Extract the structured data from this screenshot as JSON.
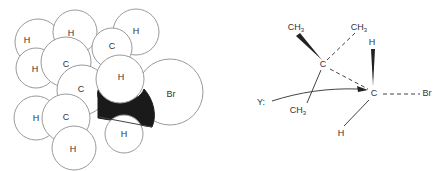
{
  "figure": {
    "space_filling_model": {
      "title": "Space-filling model of 1-bromo-2,2-dimethylpropane (neopentyl bromide)",
      "atoms": [
        {
          "label": "H",
          "cx": 38,
          "cy": 42,
          "r": 23
        },
        {
          "label": "H",
          "cx": 75,
          "cy": 32,
          "r": 22
        },
        {
          "label": "H",
          "cx": 36,
          "cy": 68,
          "r": 20
        },
        {
          "label": "C",
          "cx": 66,
          "cy": 62,
          "r": 25
        },
        {
          "label": "H",
          "cx": 136,
          "cy": 32,
          "r": 23
        },
        {
          "label": "C",
          "cx": 112,
          "cy": 48,
          "r": 20
        },
        {
          "label": "C",
          "cx": 82,
          "cy": 90,
          "r": 25
        },
        {
          "label": "H",
          "cx": 36,
          "cy": 118,
          "r": 22
        },
        {
          "label": "C",
          "cx": 66,
          "cy": 118,
          "r": 24
        },
        {
          "label": "H",
          "cx": 74,
          "cy": 148,
          "r": 22
        },
        {
          "label": "Br",
          "cx": 170,
          "cy": 92,
          "r": 33
        },
        {
          "label": "H",
          "cx": 124,
          "cy": 132,
          "r": 24
        },
        {
          "label": "H",
          "cx": 120,
          "cy": 79,
          "r": 24
        }
      ],
      "labels": [
        {
          "text": "H",
          "x": 27,
          "y": 41
        },
        {
          "text": "H",
          "x": 71,
          "y": 34
        },
        {
          "text": "H",
          "x": 35,
          "y": 70
        },
        {
          "text": "C",
          "x": 66,
          "y": 65
        },
        {
          "text": "H",
          "x": 136,
          "y": 32
        },
        {
          "text": "C",
          "x": 112,
          "y": 47
        },
        {
          "text": "C",
          "x": 81,
          "y": 90
        },
        {
          "text": "H",
          "x": 36,
          "y": 119
        },
        {
          "text": "C",
          "x": 66,
          "y": 118
        },
        {
          "text": "H",
          "x": 73,
          "y": 150
        },
        {
          "text": "Br",
          "x": 171,
          "y": 95
        },
        {
          "text": "H",
          "x": 124,
          "y": 135
        },
        {
          "text": "H",
          "x": 121,
          "y": 78
        }
      ],
      "hidden_carbon_color": "#1a1a1a"
    },
    "reaction_scheme": {
      "title": "Backside attack of nucleophile Y: on neopentyl bromide",
      "nucleophile": {
        "text": "Y:",
        "x": 261,
        "y": 103
      },
      "quaternary_carbon": {
        "text": "C",
        "x": 323,
        "y": 65
      },
      "reacting_carbon": {
        "text": "C",
        "x": 374,
        "y": 94
      },
      "methyl_top_left": {
        "text": "CH",
        "sub": "3",
        "x": 296,
        "y": 28
      },
      "methyl_top_right": {
        "text": "CH",
        "sub": "3",
        "x": 359,
        "y": 28
      },
      "methyl_bottom": {
        "text": "CH",
        "sub": "3",
        "x": 298,
        "y": 111
      },
      "hydrogen_top": {
        "text": "H",
        "x": 372,
        "y": 43
      },
      "hydrogen_bottom": {
        "text": "H",
        "x": 341,
        "y": 134
      },
      "leaving_group": {
        "text": "Br",
        "x": 427,
        "y": 94
      },
      "ink_color": "#444444"
    }
  }
}
